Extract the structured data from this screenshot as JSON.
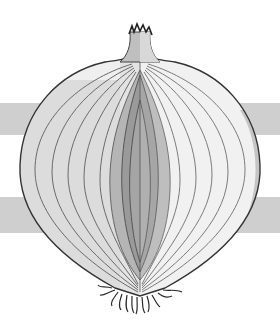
{
  "image": {
    "subject": "onion cross-section illustration",
    "description": "Grayscale drawing of a halved onion showing concentric layers, sprout tip at top, roots at bottom, over two horizontal gray bands",
    "colors": {
      "background": "#ffffff",
      "band": "#cfcfcf",
      "outline": "#3a3a3a",
      "outer_skin": "#d9d9d9",
      "layer_light": "#f2f2f2",
      "core_mid": "#a9a9a9",
      "core_dark": "#8a8a8a",
      "core_center": "#9c9c9c",
      "roots": "#2a2a2a"
    },
    "bands": [
      {
        "top": 103,
        "height": 32
      },
      {
        "top": 197,
        "height": 36
      }
    ]
  }
}
